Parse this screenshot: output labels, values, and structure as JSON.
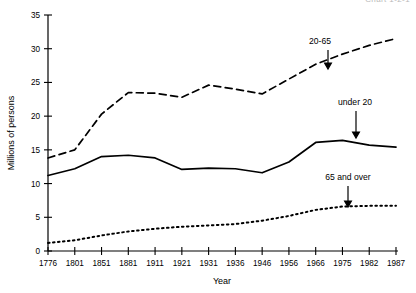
{
  "page": {
    "cut_caption": "Chart 1-2-1"
  },
  "chart_data": {
    "type": "line",
    "title": "",
    "xlabel": "Year",
    "ylabel": "Millions of persons",
    "categories": [
      "1776",
      "1801",
      "1851",
      "1881",
      "1911",
      "1921",
      "1931",
      "1936",
      "1946",
      "1956",
      "1966",
      "1975",
      "1982",
      "1987"
    ],
    "ylim": [
      0,
      35
    ],
    "yticks": [
      0,
      5,
      10,
      15,
      20,
      25,
      30,
      35
    ],
    "ytick_labels": [
      "0",
      "5",
      "10",
      "15",
      "20",
      "25",
      "30",
      "35"
    ],
    "grid": false,
    "legend_position": "inline-annotations",
    "series": [
      {
        "name": "under 20",
        "style": "solid",
        "values": [
          11.2,
          12.2,
          14.0,
          14.2,
          13.8,
          12.1,
          12.3,
          12.2,
          11.6,
          13.2,
          16.1,
          16.4,
          15.7,
          15.4
        ]
      },
      {
        "name": "20-65",
        "style": "dashed",
        "values": [
          13.8,
          15.0,
          20.3,
          23.5,
          23.4,
          22.8,
          24.6,
          24.0,
          23.3,
          25.5,
          27.7,
          29.2,
          30.5,
          31.5
        ]
      },
      {
        "name": "65 and over",
        "style": "dotted",
        "values": [
          1.2,
          1.6,
          2.3,
          2.9,
          3.3,
          3.6,
          3.8,
          4.0,
          4.5,
          5.2,
          6.1,
          6.6,
          6.7,
          6.7
        ]
      }
    ],
    "annotations": [
      {
        "label": "20-65",
        "target_series": "20-65",
        "text_x": 320,
        "text_y": 44,
        "arrow_x": 328,
        "arrow_y0": 50,
        "arrow_y1": 69
      },
      {
        "label": "under 20",
        "target_series": "under 20",
        "text_x": 355,
        "text_y": 105,
        "arrow_x": 356,
        "arrow_y0": 111,
        "arrow_y1": 138
      },
      {
        "label": "65 and over",
        "target_series": "65 and over",
        "text_x": 348,
        "text_y": 180,
        "arrow_x": 348,
        "arrow_y0": 186,
        "arrow_y1": 207
      }
    ]
  }
}
